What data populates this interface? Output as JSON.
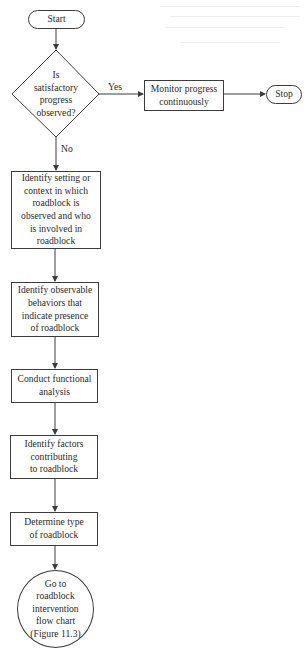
{
  "diagram": {
    "type": "flowchart",
    "colors": {
      "stroke": "#3c3c3c",
      "text": "#2a2a2a",
      "background": "#ffffff"
    },
    "nodes": {
      "start": {
        "shape": "terminator",
        "label": "Start"
      },
      "decision": {
        "shape": "diamond",
        "label": "Is\nsatisfactory\nprogress\nobserved?"
      },
      "monitor": {
        "shape": "process",
        "label": "Monitor progress\ncontinuously"
      },
      "stop": {
        "shape": "terminator",
        "label": "Stop"
      },
      "identify_setting": {
        "shape": "process",
        "label": "Identify setting or\ncontext in which\nroadblock is\nobserved and who\nis involved in\nroadblock"
      },
      "identify_behaviors": {
        "shape": "process",
        "label": "Identify observable\nbehaviors that\nindicate presence\nof roadblock"
      },
      "functional_analysis": {
        "shape": "process",
        "label": "Conduct functional\nanalysis"
      },
      "identify_factors": {
        "shape": "process",
        "label": "Identify factors\ncontributing\nto roadblock"
      },
      "determine_type": {
        "shape": "process",
        "label": "Determine type\nof roadblock"
      },
      "go_to_chart": {
        "shape": "connector",
        "label": "Go to\nroadblock\nintervention\nflow chart\n(Figure 11.3)"
      }
    },
    "edges": [
      {
        "from": "start",
        "to": "decision",
        "label": ""
      },
      {
        "from": "decision",
        "to": "monitor",
        "label": "Yes"
      },
      {
        "from": "monitor",
        "to": "stop",
        "label": ""
      },
      {
        "from": "decision",
        "to": "identify_setting",
        "label": "No"
      },
      {
        "from": "identify_setting",
        "to": "identify_behaviors",
        "label": ""
      },
      {
        "from": "identify_behaviors",
        "to": "functional_analysis",
        "label": ""
      },
      {
        "from": "functional_analysis",
        "to": "identify_factors",
        "label": ""
      },
      {
        "from": "identify_factors",
        "to": "determine_type",
        "label": ""
      },
      {
        "from": "determine_type",
        "to": "go_to_chart",
        "label": ""
      }
    ],
    "edge_labels": {
      "yes": "Yes",
      "no": "No"
    }
  }
}
